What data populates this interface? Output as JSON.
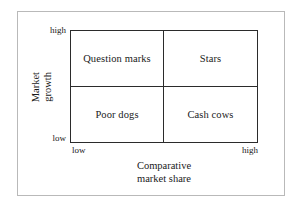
{
  "chart_data": {
    "type": "table",
    "title": "",
    "subtitle": "",
    "xlabel": "Comparative market share",
    "ylabel": "Market growth",
    "grid": false,
    "legend": "none",
    "x_tick_labels": [
      "low",
      "high"
    ],
    "y_tick_labels": [
      "low",
      "high"
    ],
    "categories": [
      "low market share",
      "high market share"
    ],
    "rows": [
      "high market growth",
      "low market growth"
    ],
    "cells": [
      [
        "Question marks",
        "Stars"
      ],
      [
        "Poor dogs",
        "Cash cows"
      ]
    ],
    "quadrants": [
      {
        "id": "question-marks",
        "label": "Question marks",
        "market_share": "low",
        "market_growth": "high"
      },
      {
        "id": "stars",
        "label": "Stars",
        "market_share": "high",
        "market_growth": "high"
      },
      {
        "id": "poor-dogs",
        "label": "Poor dogs",
        "market_share": "low",
        "market_growth": "low"
      },
      {
        "id": "cash-cows",
        "label": "Cash cows",
        "market_share": "high",
        "market_growth": "low"
      }
    ]
  },
  "axes": {
    "y": {
      "title_line1": "Market",
      "title_line2": "growth",
      "tick_high": "high",
      "tick_low": "low"
    },
    "x": {
      "title_line1": "Comparative",
      "title_line2": "market share",
      "tick_low": "low",
      "tick_high": "high"
    }
  },
  "quadrant_labels": {
    "top_left": "Question marks",
    "top_right": "Stars",
    "bottom_left": "Poor dogs",
    "bottom_right": "Cash cows"
  },
  "colors": {
    "background": "#ffffff",
    "matrix_line": "#2b2b2b",
    "outer_frame": "#b9b9b9",
    "text": "#1a1a1a"
  }
}
